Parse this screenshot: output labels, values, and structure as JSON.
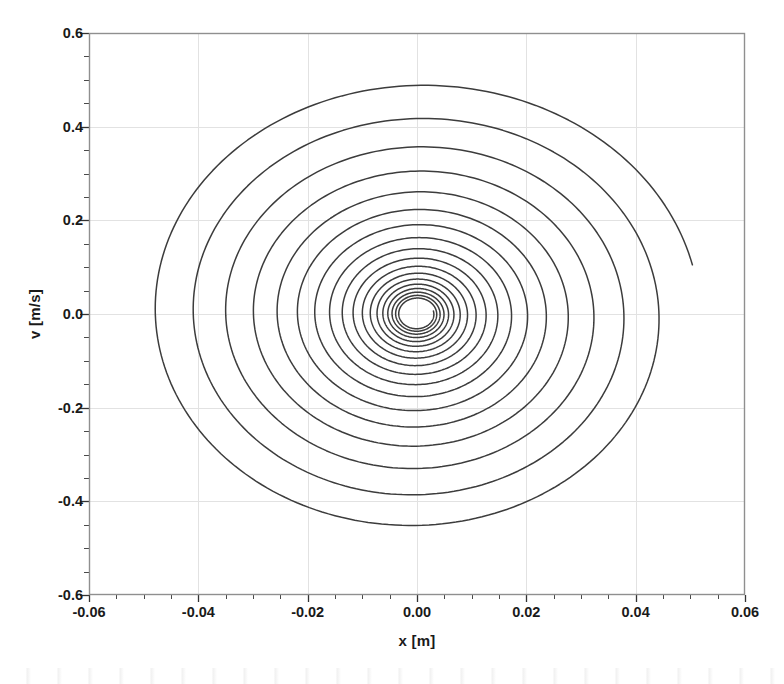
{
  "chart_data": {
    "type": "line",
    "title": "",
    "subtitle": "",
    "xlabel": "x [m]",
    "ylabel": "v [m/s]",
    "xlim": [
      -0.06,
      0.06
    ],
    "ylim": [
      -0.6,
      0.6
    ],
    "xticks": [
      -0.06,
      -0.04,
      -0.02,
      0.0,
      0.02,
      0.04,
      0.06
    ],
    "xticklabels": [
      "-0.06",
      "-0.04",
      "-0.02",
      "0.00",
      "0.02",
      "0.04",
      "0.06"
    ],
    "yticks": [
      -0.6,
      -0.4,
      -0.2,
      0.0,
      0.2,
      0.4,
      0.6
    ],
    "yticklabels": [
      "-0.6",
      "-0.4",
      "-0.2",
      "0.0",
      "0.2",
      "0.4",
      "0.6"
    ],
    "x_minor_tick_step": 0.005,
    "y_minor_tick_step": 0.05,
    "grid": true,
    "grid_color": "#e2e2e2",
    "legend": null,
    "legend_position": "none",
    "line_color": "#3c3c3c",
    "line_width": 1.5,
    "frame_color": "#8f8f8f",
    "background": "#ffffff",
    "spiral": {
      "start_x": 0.0503,
      "start_v": 0.105,
      "end_x": 0.0,
      "end_v": 0.0,
      "center_x": 0.0,
      "center_v": 0.0,
      "revolutions": 18.0,
      "start_angle_deg": 12.0,
      "direction": "clockwise",
      "x_amplitude_initial": 0.0515,
      "v_amplitude_initial": 0.505,
      "decay_per_revolution": 0.855,
      "inner_cut_radius_x": 0.0013,
      "peak_v_max": 0.455,
      "peak_v_min": -0.485,
      "peak_x_min": -0.0465,
      "peak_x_max": 0.0503
    },
    "series": [
      {
        "name": "trajectory",
        "revolution_extrema": [
          {
            "rev": 1,
            "x_max": 0.0503,
            "x_min": -0.0465,
            "v_max": 0.455,
            "v_min": -0.485
          },
          {
            "rev": 2,
            "x_max": 0.0432,
            "x_min": -0.04,
            "v_max": 0.388,
            "v_min": -0.418
          },
          {
            "rev": 3,
            "x_max": 0.0372,
            "x_min": -0.0343,
            "v_max": 0.333,
            "v_min": -0.355
          },
          {
            "rev": 4,
            "x_max": 0.0318,
            "x_min": -0.0294,
            "v_max": 0.286,
            "v_min": -0.303
          },
          {
            "rev": 5,
            "x_max": 0.0272,
            "x_min": -0.0252,
            "v_max": 0.244,
            "v_min": -0.258
          },
          {
            "rev": 6,
            "x_max": 0.0233,
            "x_min": -0.0216,
            "v_max": 0.209,
            "v_min": -0.22
          },
          {
            "rev": 7,
            "x_max": 0.0199,
            "x_min": -0.0185,
            "v_max": 0.178,
            "v_min": -0.188
          },
          {
            "rev": 8,
            "x_max": 0.0171,
            "x_min": -0.0158,
            "v_max": 0.152,
            "v_min": -0.161
          },
          {
            "rev": 9,
            "x_max": 0.0146,
            "x_min": -0.0135,
            "v_max": 0.13,
            "v_min": -0.137
          },
          {
            "rev": 10,
            "x_max": 0.0125,
            "x_min": -0.0116,
            "v_max": 0.111,
            "v_min": -0.117
          },
          {
            "rev": 11,
            "x_max": 0.0107,
            "x_min": -0.0099,
            "v_max": 0.095,
            "v_min": -0.1
          },
          {
            "rev": 12,
            "x_max": 0.0091,
            "x_min": -0.0085,
            "v_max": 0.081,
            "v_min": -0.086
          },
          {
            "rev": 13,
            "x_max": 0.0078,
            "x_min": -0.0072,
            "v_max": 0.069,
            "v_min": -0.073
          },
          {
            "rev": 14,
            "x_max": 0.0067,
            "x_min": -0.0062,
            "v_max": 0.059,
            "v_min": -0.063
          },
          {
            "rev": 15,
            "x_max": 0.0057,
            "x_min": -0.0053,
            "v_max": 0.051,
            "v_min": -0.053
          },
          {
            "rev": 16,
            "x_max": 0.0049,
            "x_min": -0.0045,
            "v_max": 0.043,
            "v_min": -0.046
          },
          {
            "rev": 17,
            "x_max": 0.0042,
            "x_min": -0.0039,
            "v_max": 0.037,
            "v_min": -0.039
          },
          {
            "rev": 18,
            "x_max": 0.0036,
            "x_min": -0.0033,
            "v_max": 0.031,
            "v_min": -0.033
          }
        ]
      }
    ]
  },
  "axes": {
    "plot_left_px": 89,
    "plot_right_px": 745,
    "plot_top_px": 33,
    "plot_bottom_px": 595
  }
}
